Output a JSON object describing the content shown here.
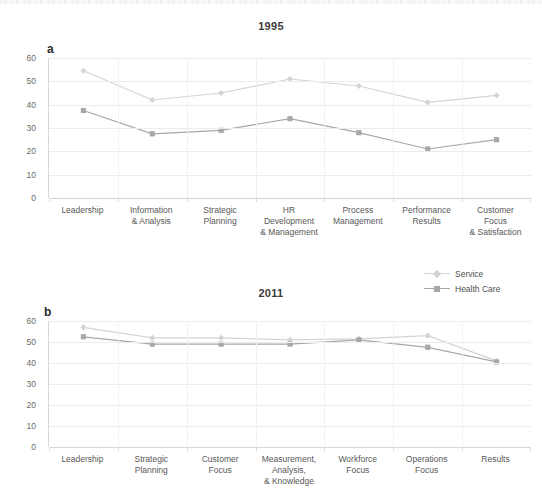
{
  "figure": {
    "legend": {
      "entries": [
        {
          "label": "Service",
          "color": "#d4d4d4",
          "marker": "diamond"
        },
        {
          "label": "Health Care",
          "color": "#a8a8a8",
          "marker": "square"
        }
      ]
    }
  },
  "chart_data": [
    {
      "type": "line",
      "title": "1995",
      "panel_label": "a",
      "xlabel": "",
      "ylabel": "",
      "ylim": [
        0,
        60
      ],
      "yticks": [
        0,
        10,
        20,
        30,
        40,
        50,
        60
      ],
      "ytick_labels": [
        "0",
        "10",
        "20",
        "30",
        "40",
        "50",
        "60"
      ],
      "grid": true,
      "legend_position": "below-right",
      "categories": [
        "Leadership",
        "Information\n& Analysis",
        "Strategic\nPlanning",
        "HR\nDevelopment\n& Management",
        "Process\nManagement",
        "Performance\nResults",
        "Customer\nFocus\n& Satisfaction"
      ],
      "series": [
        {
          "name": "Service",
          "color": "#d4d4d4",
          "marker": "diamond",
          "values": [
            54.5,
            42,
            45,
            51,
            48,
            41,
            44
          ]
        },
        {
          "name": "Health Care",
          "color": "#a8a8a8",
          "marker": "square",
          "values": [
            37.5,
            27.5,
            29,
            34,
            28,
            21,
            25
          ]
        }
      ]
    },
    {
      "type": "line",
      "title": "2011",
      "panel_label": "b",
      "xlabel": "",
      "ylabel": "",
      "ylim": [
        0,
        60
      ],
      "yticks": [
        0,
        10,
        20,
        30,
        40,
        50,
        60
      ],
      "ytick_labels": [
        "0",
        "10",
        "20",
        "30",
        "40",
        "50",
        "60"
      ],
      "grid": true,
      "legend_position": "none",
      "categories": [
        "Leadership",
        "Strategic\nPlanning",
        "Customer\nFocus",
        "Measurement,\nAnalysis,\n& Knowledge",
        "Workforce\nFocus",
        "Operations\nFocus",
        "Results"
      ],
      "series": [
        {
          "name": "Service",
          "color": "#d4d4d4",
          "marker": "diamond",
          "values": [
            57,
            52,
            52,
            51,
            51.5,
            53,
            41
          ]
        },
        {
          "name": "Health Care",
          "color": "#a8a8a8",
          "marker": "square",
          "values": [
            52.5,
            49,
            49,
            49,
            51,
            47.5,
            40.5
          ]
        }
      ]
    }
  ]
}
